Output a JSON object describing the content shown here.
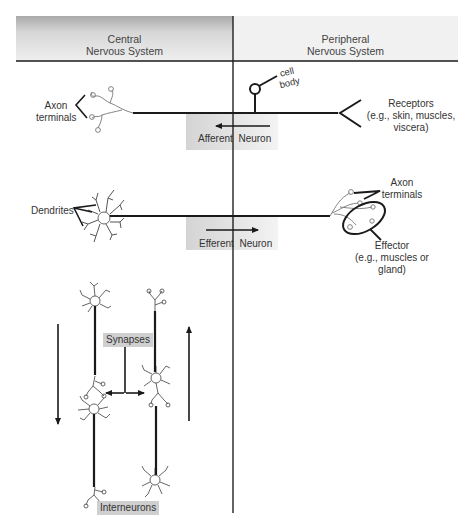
{
  "header": {
    "left": {
      "line1": "Central",
      "line2": "Nervous System"
    },
    "right": {
      "line1": "Peripheral",
      "line2": "Nervous System"
    }
  },
  "afferent": {
    "label_left": "Afferent",
    "label_right": "Neuron",
    "direction": "left",
    "axon_terminals": {
      "line1": "Axon",
      "line2": "terminals"
    },
    "cell_body": {
      "line1": "cell",
      "line2": "body"
    },
    "receptors": {
      "line1": "Receptors",
      "line2": "(e.g., skin, muscles,",
      "line3": "viscera)"
    }
  },
  "efferent": {
    "label_left": "Efferent",
    "label_right": "Neuron",
    "direction": "right",
    "dendrites": "Dendrites",
    "axon_terminals": {
      "line1": "Axon",
      "line2": "terminals"
    },
    "effector": {
      "line1": "Effector",
      "line2": "(e.g., muscles or",
      "line3": "gland)"
    }
  },
  "interneurons": {
    "synapses_label": "Synapses",
    "interneurons_label": "Interneurons",
    "left_arrow_direction": "down",
    "right_arrow_direction": "up"
  },
  "colors": {
    "line": "#1a1a1a",
    "neuron_outline": "#666666",
    "tag_bg": "#cfcfcf",
    "header_grad_dark": "#a9a9a9",
    "header_light": "#f1f1f1"
  }
}
